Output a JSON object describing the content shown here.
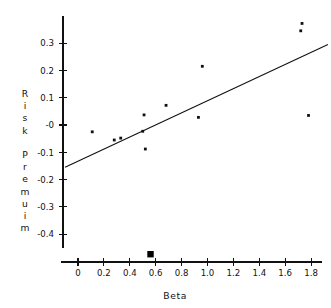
{
  "chart_data": {
    "type": "scatter",
    "title": "",
    "xlabel": "Beta",
    "ylabel": "Risk Premuim",
    "ylabel_chars": [
      "R",
      "i",
      "s",
      "k",
      "",
      "P",
      "r",
      "e",
      "m",
      "u",
      "i",
      "m"
    ],
    "xlim": [
      -0.1,
      1.95
    ],
    "ylim": [
      -0.47,
      0.38
    ],
    "grid": false,
    "legend": "none",
    "xticks": [
      0,
      0.2,
      0.4,
      0.6,
      0.8,
      1.0,
      1.2,
      1.4,
      1.6,
      1.8
    ],
    "xticklabels": [
      "0",
      "0.2",
      "0.4",
      "0.6",
      "0.8",
      "1.0",
      "1.2",
      "1.4",
      "1.6",
      "1.8"
    ],
    "yticks": [
      0.3,
      0.2,
      0.1,
      0.0,
      -0.1,
      -0.2,
      -0.3,
      -0.4
    ],
    "yticklabels": [
      "0.3",
      "0.2",
      "0.1",
      "-0",
      "-0.1",
      "-0.2",
      "-0.3",
      "-0.4"
    ],
    "points": [
      {
        "x": 0.11,
        "y": -0.025
      },
      {
        "x": 0.28,
        "y": -0.055
      },
      {
        "x": 0.33,
        "y": -0.048
      },
      {
        "x": 0.5,
        "y": -0.023
      },
      {
        "x": 0.51,
        "y": 0.037
      },
      {
        "x": 0.52,
        "y": -0.088
      },
      {
        "x": 0.68,
        "y": 0.072
      },
      {
        "x": 0.93,
        "y": 0.028
      },
      {
        "x": 0.96,
        "y": 0.215
      },
      {
        "x": 1.72,
        "y": 0.345
      },
      {
        "x": 1.73,
        "y": 0.372
      },
      {
        "x": 1.78,
        "y": 0.035
      }
    ],
    "fit_line": {
      "label": "regression line",
      "x1": -0.1,
      "y1": -0.155,
      "x2": 1.93,
      "y2": 0.295,
      "slope": 0.2217,
      "intercept": -0.1328
    },
    "axis_marker": {
      "label": "market beta marker",
      "shape": "filled-square",
      "x": 0.56,
      "y": -0.435
    }
  },
  "axes": {
    "x_title": "Beta",
    "y_title": "Risk Premuim"
  }
}
